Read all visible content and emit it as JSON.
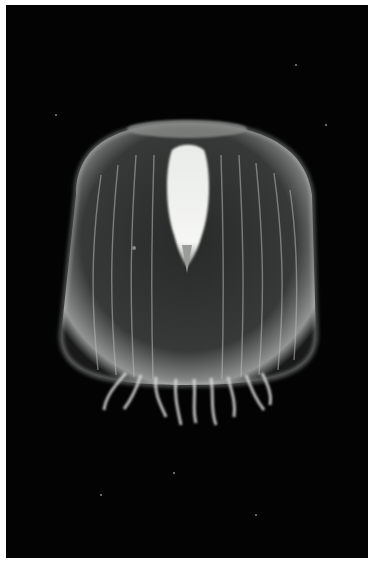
{
  "image": {
    "subject": "jellyfish",
    "description": "Translucent bell-shaped jellyfish glowing against a black background, with short curled tentacles at the base",
    "background_color": "#030303",
    "frame_color": "#ffffff",
    "glow_color": "#e8ece8"
  }
}
